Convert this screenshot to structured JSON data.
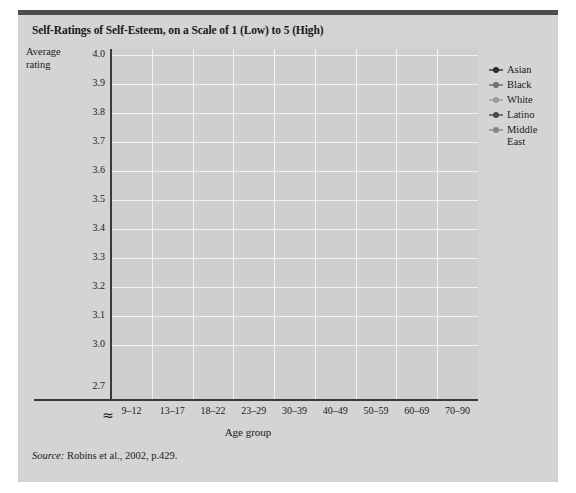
{
  "figure": {
    "title": "Self-Ratings of Self-Esteem, on a Scale of 1 (Low) to 5 (High)",
    "ylabel_line1": "Average",
    "ylabel_line2": "rating",
    "source_prefix": "Source:",
    "source_text": "Robins et al., 2002, p.429.",
    "axis_break_symbol": "≈",
    "colors": {
      "figure_background": "#d4d4d4",
      "plot_background": "#cfcfcf",
      "grid": "#f2f2f2",
      "axis": "#3a3a3a",
      "top_bar": "#4c4c52",
      "asian": "#2b2b2b",
      "black": "#6e6e6e",
      "white": "#9a9a9a",
      "latino": "#4a4a4a",
      "middle_east": "#858585"
    }
  },
  "chart_data": {
    "type": "line",
    "title": "Self-Ratings of Self-Esteem, on a Scale of 1 (Low) to 5 (High)",
    "xlabel": "Age group",
    "ylabel": "Average rating",
    "categories": [
      "9–12",
      "13–17",
      "18–22",
      "23–29",
      "30–39",
      "40–49",
      "50–59",
      "60–69",
      "70–90"
    ],
    "ylim": [
      2.65,
      4.0
    ],
    "yticks": [
      "4.0",
      "3.9",
      "3.8",
      "3.7",
      "3.6",
      "3.5",
      "3.4",
      "3.3",
      "3.2",
      "3.1",
      "3.0",
      "2.7"
    ],
    "ytick_values": [
      4.0,
      3.9,
      3.8,
      3.7,
      3.6,
      3.5,
      3.4,
      3.3,
      3.2,
      3.1,
      3.0,
      2.7
    ],
    "axis_break_between": [
      3.0,
      2.7
    ],
    "grid": true,
    "legend_position": "right",
    "series": [
      {
        "name": "Asian",
        "color": "#2b2b2b",
        "values": [
          3.56,
          3.31,
          3.29,
          3.46,
          3.66,
          3.71,
          3.83,
          3.73,
          2.99
        ]
      },
      {
        "name": "Black",
        "color": "#6e6e6e",
        "values": [
          3.78,
          3.67,
          3.61,
          3.73,
          3.75,
          3.8,
          3.69,
          3.91,
          3.65
        ]
      },
      {
        "name": "White",
        "color": "#9a9a9a",
        "values": [
          3.72,
          3.51,
          3.5,
          3.73,
          3.73,
          3.72,
          3.94,
          3.76,
          3.16
        ]
      },
      {
        "name": "Latino",
        "color": "#4a4a4a",
        "values": [
          3.74,
          3.36,
          3.36,
          3.72,
          3.75,
          3.71,
          3.94,
          3.73,
          3.14
        ]
      },
      {
        "name": "Middle East",
        "color": "#858585",
        "values": [
          3.63,
          3.35,
          3.35,
          3.36,
          3.35,
          3.35,
          3.51,
          3.42,
          2.68
        ]
      }
    ]
  },
  "legend": {
    "items": [
      {
        "label": "Asian"
      },
      {
        "label": "Black"
      },
      {
        "label": "White"
      },
      {
        "label": "Latino"
      },
      {
        "label": "Middle"
      },
      {
        "label": "East"
      }
    ]
  }
}
